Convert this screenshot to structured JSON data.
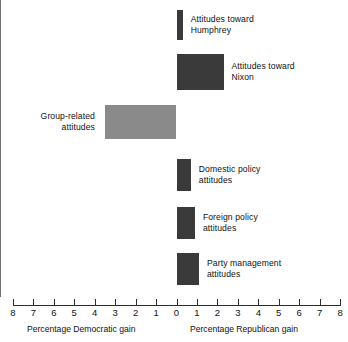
{
  "chart_data": {
    "type": "bar",
    "orientation": "horizontal",
    "title": "",
    "subtitle": "",
    "xlabel_left": "Percentage Democratic gain",
    "xlabel_right": "Percentage Republican gain",
    "ylabel": "",
    "xlim": [
      -8,
      8
    ],
    "grid": false,
    "legend": "none",
    "tick_labels": [
      "8",
      "7",
      "6",
      "5",
      "4",
      "3",
      "2",
      "1",
      "0",
      "1",
      "2",
      "3",
      "4",
      "5",
      "6",
      "7",
      "8"
    ],
    "tick_values": [
      -8,
      -7,
      -6,
      -5,
      -4,
      -3,
      -2,
      -1,
      0,
      1,
      2,
      3,
      4,
      5,
      6,
      7,
      8
    ],
    "categories": [
      "Attitudes toward Humphrey",
      "Attitudes toward Nixon",
      "Group-related attitudes",
      "Domestic policy attitudes",
      "Foreign policy attitudes",
      "Party management attitudes"
    ],
    "values": [
      0.3,
      2.3,
      -3.5,
      0.7,
      0.9,
      1.1
    ],
    "bars": [
      {
        "label": "Attitudes toward\nHumphrey",
        "value": 0.3,
        "direction": "republican",
        "color": "#3a3a3a"
      },
      {
        "label": "Attitudes toward\nNixon",
        "value": 2.3,
        "direction": "republican",
        "color": "#3a3a3a"
      },
      {
        "label": "Group-related\nattitudes",
        "value": -3.5,
        "direction": "democratic",
        "color": "#8a8a8a"
      },
      {
        "label": "Domestic policy\nattitudes",
        "value": 0.7,
        "direction": "republican",
        "color": "#3a3a3a"
      },
      {
        "label": "Foreign policy\nattitudes",
        "value": 0.9,
        "direction": "republican",
        "color": "#3a3a3a"
      },
      {
        "label": "Party management\nattitudes",
        "value": 1.1,
        "direction": "republican",
        "color": "#3a3a3a"
      }
    ],
    "colors": {
      "republican_bar": "#3a3a3a",
      "democratic_bar": "#8a8a8a",
      "axis": "#2c2c2c",
      "zero_line": "#6e6e6e",
      "background": "#ffffff"
    }
  }
}
